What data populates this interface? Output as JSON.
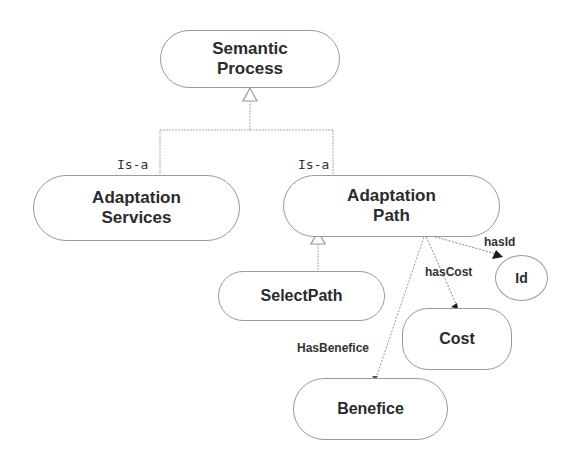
{
  "diagram": {
    "nodes": {
      "semantic_process": "Semantic\nProcess",
      "adaptation_services": "Adaptation\nServices",
      "adaptation_path": "Adaptation\nPath",
      "select_path": "SelectPath",
      "id": "Id",
      "cost": "Cost",
      "benefice": "Benefice"
    },
    "edges": {
      "is_a_left": "Is-a",
      "is_a_right": "Is-a",
      "has_id": "hasId",
      "has_cost": "hasCost",
      "has_benefice": "HasBenefice"
    },
    "colors": {
      "border": "#9a9a9a",
      "text": "#2b2b2b",
      "edge": "#aaaaaa",
      "arrow": "#1a1a1a"
    }
  }
}
